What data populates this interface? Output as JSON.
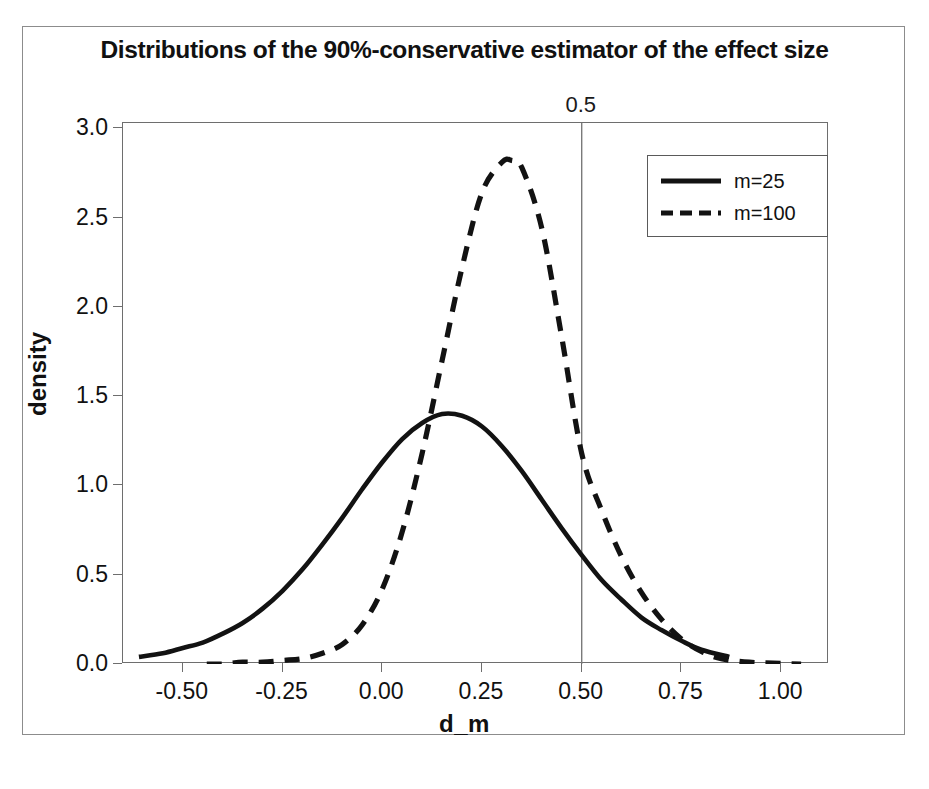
{
  "chart_data": {
    "type": "line",
    "title": "Distributions of the 90%-conservative estimator of the effect size",
    "xlabel": "d_m",
    "ylabel": "density",
    "xlim": [
      -0.65,
      1.12
    ],
    "ylim": [
      0.0,
      3.03
    ],
    "grid": false,
    "legend_position": "top-right",
    "xticks": [
      "-0.50",
      "-0.25",
      "0.00",
      "0.25",
      "0.50",
      "0.75",
      "1.00"
    ],
    "xtick_values": [
      -0.5,
      -0.25,
      0.0,
      0.25,
      0.5,
      0.75,
      1.0
    ],
    "yticks": [
      "0.0",
      "0.5",
      "1.0",
      "1.5",
      "2.0",
      "2.5",
      "3.0"
    ],
    "ytick_values": [
      0.0,
      0.5,
      1.0,
      1.5,
      2.0,
      2.5,
      3.0
    ],
    "annotations": [
      {
        "name": "reference-line-label",
        "text": "0.5",
        "x": 0.5,
        "position": "above-axes"
      }
    ],
    "reference_lines": [
      {
        "orientation": "vertical",
        "x": 0.5,
        "style": "solid",
        "color": "#7a7a7a"
      }
    ],
    "series": [
      {
        "name": "m=25",
        "label": "m=25",
        "style": "solid",
        "color": "#121212",
        "peak_x": 0.15,
        "peak_y": 1.4,
        "x": [
          -0.61,
          -0.55,
          -0.5,
          -0.45,
          -0.4,
          -0.35,
          -0.3,
          -0.25,
          -0.2,
          -0.15,
          -0.1,
          -0.05,
          0.0,
          0.05,
          0.1,
          0.15,
          0.2,
          0.25,
          0.3,
          0.35,
          0.4,
          0.45,
          0.5,
          0.55,
          0.6,
          0.65,
          0.7,
          0.75,
          0.8,
          0.87
        ],
        "y": [
          0.04,
          0.06,
          0.09,
          0.12,
          0.17,
          0.23,
          0.31,
          0.41,
          0.53,
          0.67,
          0.82,
          0.98,
          1.13,
          1.26,
          1.35,
          1.4,
          1.39,
          1.33,
          1.22,
          1.08,
          0.92,
          0.76,
          0.61,
          0.47,
          0.36,
          0.26,
          0.19,
          0.13,
          0.08,
          0.04
        ]
      },
      {
        "name": "m=100",
        "label": "m=100",
        "style": "dashed",
        "color": "#121212",
        "peak_x": 0.325,
        "peak_y": 2.82,
        "x": [
          -0.44,
          -0.4,
          -0.35,
          -0.3,
          -0.25,
          -0.2,
          -0.15,
          -0.1,
          -0.05,
          0.0,
          0.05,
          0.1,
          0.15,
          0.2,
          0.25,
          0.3,
          0.325,
          0.35,
          0.4,
          0.45,
          0.5,
          0.55,
          0.6,
          0.65,
          0.7,
          0.75,
          0.8,
          0.85,
          0.92,
          1.05
        ],
        "y": [
          0.0,
          0.0,
          0.01,
          0.01,
          0.02,
          0.03,
          0.06,
          0.11,
          0.22,
          0.42,
          0.74,
          1.18,
          1.7,
          2.22,
          2.64,
          2.81,
          2.82,
          2.78,
          2.44,
          1.83,
          1.18,
          0.86,
          0.6,
          0.4,
          0.25,
          0.14,
          0.07,
          0.03,
          0.01,
          0.0
        ]
      }
    ]
  }
}
